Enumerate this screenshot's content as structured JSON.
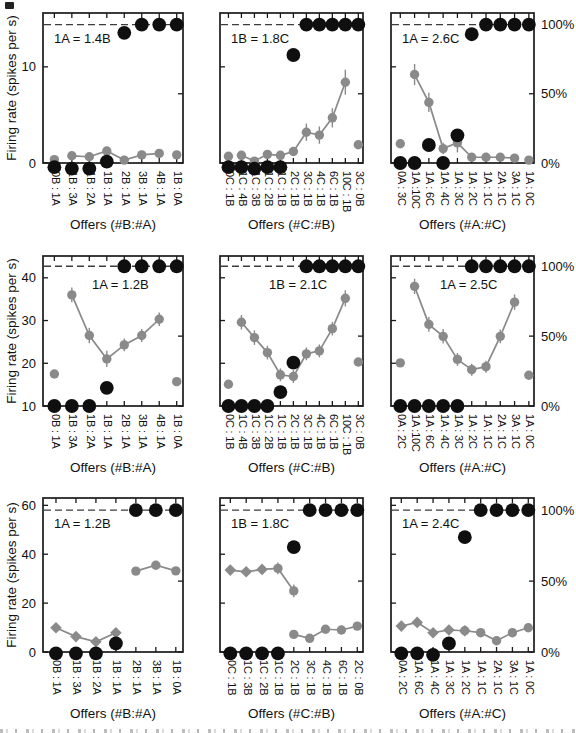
{
  "figure": {
    "y_axis_label": "Firing rate (spikes per s)",
    "pct_axis_labels": {
      "p100": "100%",
      "p50": "50%",
      "p0": "0%"
    },
    "colors": {
      "gray": "#8a8a8a",
      "black": "#0f0f0f",
      "frame": "#1a1a1a",
      "dash": "#3c3c3c",
      "text": "#111111",
      "bg": "#ffffff"
    }
  },
  "chart_data": [
    {
      "id": "r1c1",
      "row": 0,
      "col": 0,
      "type": "scatter-line",
      "title": "1A = 1.4B",
      "xlabel": "Offers (#B:#A)",
      "categories": [
        "0B : 1A",
        "1B : 3A",
        "1B : 2A",
        "1B : 1A",
        "2B : 1A",
        "3B : 1A",
        "4B : 1A",
        "1B : 0A"
      ],
      "left_axis": {
        "ylim": [
          0,
          15.6
        ],
        "ticks": [
          0,
          10
        ],
        "pct100_value": 14.4
      },
      "right_axis": {
        "ticks_pct": [
          0,
          50,
          100
        ]
      },
      "choice_pct_black": [
        -3,
        -4,
        -4,
        1,
        94,
        100,
        100,
        100
      ],
      "firing_gray": [
        {
          "connected": false,
          "marker": "circle",
          "points": [
            {
              "i": 0,
              "v": 0.35,
              "e": 0
            }
          ]
        },
        {
          "connected": true,
          "marker": "circle",
          "points": [
            {
              "i": 1,
              "v": 0.75,
              "e": 0.3
            },
            {
              "i": 2,
              "v": 0.65,
              "e": 0.3
            },
            {
              "i": 3,
              "v": 1.25,
              "e": 0.4
            },
            {
              "i": 4,
              "v": 0.3,
              "e": 0.2
            },
            {
              "i": 5,
              "v": 0.85,
              "e": 0.3
            },
            {
              "i": 6,
              "v": 1.0,
              "e": 0.3
            }
          ]
        },
        {
          "connected": false,
          "marker": "circle",
          "points": [
            {
              "i": 7,
              "v": 0.85,
              "e": 0
            }
          ]
        }
      ]
    },
    {
      "id": "r1c2",
      "row": 0,
      "col": 1,
      "type": "scatter-line",
      "title": "1B = 1.8C",
      "xlabel": "Offers (#C:#B)",
      "categories": [
        "0C : 1B",
        "1C : 4B",
        "1C : 3B",
        "1C : 2B",
        "1C : 1B",
        "2C : 1B",
        "3C : 1B",
        "4C : 1B",
        "6C : 1B",
        "10C : 1B",
        "3C : 0B"
      ],
      "left_axis": {
        "ylim": [
          0,
          15.6
        ],
        "ticks": [
          0,
          10
        ],
        "pct100_value": 14.4
      },
      "right_axis": {
        "ticks_pct": [
          0,
          50,
          100
        ]
      },
      "choice_pct_black": [
        -3,
        -3,
        -4,
        -3,
        -3,
        78,
        100,
        100,
        100,
        100,
        100
      ],
      "firing_gray": [
        {
          "connected": false,
          "marker": "circle",
          "points": [
            {
              "i": 0,
              "v": 0.7,
              "e": 0
            }
          ]
        },
        {
          "connected": true,
          "marker": "circle",
          "points": [
            {
              "i": 1,
              "v": 0.8,
              "e": 0.2
            },
            {
              "i": 2,
              "v": 0.2,
              "e": 0.2
            },
            {
              "i": 3,
              "v": 0.9,
              "e": 0.2
            },
            {
              "i": 4,
              "v": 0.8,
              "e": 0.3
            },
            {
              "i": 5,
              "v": 1.2,
              "e": 0.4
            },
            {
              "i": 6,
              "v": 3.2,
              "e": 0.9
            },
            {
              "i": 7,
              "v": 2.9,
              "e": 0.9
            },
            {
              "i": 8,
              "v": 4.7,
              "e": 1.0
            },
            {
              "i": 9,
              "v": 8.4,
              "e": 1.3
            }
          ]
        },
        {
          "connected": false,
          "marker": "circle",
          "points": [
            {
              "i": 10,
              "v": 1.9,
              "e": 0
            }
          ]
        }
      ]
    },
    {
      "id": "r1c3",
      "row": 0,
      "col": 2,
      "type": "scatter-line",
      "title": "1A = 2.6C",
      "xlabel": "Offers (#A:#C)",
      "categories": [
        "0A : 3C",
        "1A :10C",
        "1A : 6C",
        "1A : 4C",
        "1A : 3C",
        "1A : 2C",
        "1A : 1C",
        "2A : 1C",
        "3A : 1C",
        "1A : 0C"
      ],
      "left_axis": {
        "ylim": [
          0,
          15.6
        ],
        "ticks": [
          0,
          10
        ],
        "pct100_value": 14.4
      },
      "right_axis": {
        "ticks_pct": [
          0,
          50,
          100
        ]
      },
      "choice_pct_black": [
        0,
        0,
        13,
        0,
        20,
        93,
        100,
        100,
        100,
        100
      ],
      "firing_gray": [
        {
          "connected": false,
          "marker": "circle",
          "points": [
            {
              "i": 0,
              "v": 2.0,
              "e": 0
            }
          ]
        },
        {
          "connected": true,
          "marker": "circle",
          "points": [
            {
              "i": 1,
              "v": 9.2,
              "e": 1.1
            },
            {
              "i": 2,
              "v": 6.3,
              "e": 1.0
            },
            {
              "i": 3,
              "v": 1.5,
              "e": 0.6
            },
            {
              "i": 4,
              "v": 2.1,
              "e": 1.0
            },
            {
              "i": 5,
              "v": 0.6,
              "e": 0.2
            },
            {
              "i": 6,
              "v": 0.6,
              "e": 0.2
            },
            {
              "i": 7,
              "v": 0.6,
              "e": 0.2
            },
            {
              "i": 8,
              "v": 0.5,
              "e": 0.2
            }
          ]
        },
        {
          "connected": false,
          "marker": "circle",
          "points": [
            {
              "i": 9,
              "v": 0.3,
              "e": 0
            }
          ]
        }
      ]
    },
    {
      "id": "r2c1",
      "row": 1,
      "col": 0,
      "type": "scatter-line",
      "title": "1A = 1.2B",
      "xlabel": "Offers (#B:#A)",
      "categories": [
        "0B : 1A",
        "1B : 3A",
        "1B : 2A",
        "1B : 1A",
        "2B : 1A",
        "3B : 1A",
        "4B : 1A",
        "1B : 0A"
      ],
      "left_axis": {
        "ylim": [
          10,
          45.1
        ],
        "ticks": [
          10,
          20,
          30,
          40
        ],
        "pct100_value": 42.7
      },
      "right_axis": {
        "ticks_pct": [
          0,
          50,
          100
        ]
      },
      "choice_pct_black": [
        0,
        0,
        0,
        13,
        100,
        100,
        100,
        100
      ],
      "firing_gray": [
        {
          "connected": false,
          "marker": "circle",
          "points": [
            {
              "i": 0,
              "v": 17.5,
              "e": 0
            }
          ]
        },
        {
          "connected": true,
          "marker": "circle",
          "points": [
            {
              "i": 1,
              "v": 36.0,
              "e": 1.7
            },
            {
              "i": 2,
              "v": 26.5,
              "e": 1.8
            },
            {
              "i": 3,
              "v": 21.0,
              "e": 1.9
            },
            {
              "i": 4,
              "v": 24.3,
              "e": 1.5
            },
            {
              "i": 5,
              "v": 26.5,
              "e": 1.5
            },
            {
              "i": 6,
              "v": 30.3,
              "e": 1.6
            }
          ]
        },
        {
          "connected": false,
          "marker": "circle",
          "points": [
            {
              "i": 7,
              "v": 15.7,
              "e": 0
            }
          ]
        }
      ]
    },
    {
      "id": "r2c2",
      "row": 1,
      "col": 1,
      "type": "scatter-line",
      "title": "1B = 2.1C",
      "xlabel": "Offers (#C:#B)",
      "categories": [
        "0C : 1B",
        "1C : 4B",
        "1C : 3B",
        "1C : 2B",
        "1C : 1B",
        "2C : 1B",
        "3C : 1B",
        "4C : 1B",
        "6C : 1B",
        "10C : 1B",
        "3C : 0B"
      ],
      "left_axis": {
        "ylim": [
          10,
          45.1
        ],
        "ticks": [
          10,
          20,
          30,
          40
        ],
        "pct100_value": 42.7
      },
      "right_axis": {
        "ticks_pct": [
          0,
          50,
          100
        ]
      },
      "choice_pct_black": [
        0,
        0,
        0,
        0,
        10,
        31,
        100,
        100,
        100,
        100,
        100
      ],
      "firing_gray": [
        {
          "connected": false,
          "marker": "circle",
          "points": [
            {
              "i": 0,
              "v": 15.1,
              "e": 0
            }
          ]
        },
        {
          "connected": true,
          "marker": "circle",
          "points": [
            {
              "i": 1,
              "v": 29.6,
              "e": 1.7
            },
            {
              "i": 2,
              "v": 26.0,
              "e": 1.7
            },
            {
              "i": 3,
              "v": 22.5,
              "e": 1.6
            },
            {
              "i": 4,
              "v": 17.3,
              "e": 1.5
            },
            {
              "i": 5,
              "v": 16.9,
              "e": 1.5
            },
            {
              "i": 6,
              "v": 22.2,
              "e": 1.5
            },
            {
              "i": 7,
              "v": 22.9,
              "e": 1.5
            },
            {
              "i": 8,
              "v": 28.1,
              "e": 1.6
            },
            {
              "i": 9,
              "v": 35.2,
              "e": 1.9
            }
          ]
        },
        {
          "connected": false,
          "marker": "circle",
          "points": [
            {
              "i": 10,
              "v": 20.3,
              "e": 0
            }
          ]
        }
      ]
    },
    {
      "id": "r2c3",
      "row": 1,
      "col": 2,
      "type": "scatter-line",
      "title": "1A = 2.5C",
      "xlabel": "Offers (#A:#C)",
      "categories": [
        "0A : 2C",
        "1A :10C",
        "1A : 6C",
        "1A : 4C",
        "1A : 3C",
        "1A : 2C",
        "1A : 1C",
        "2A : 1C",
        "3A : 1C",
        "1A : 0C"
      ],
      "left_axis": {
        "ylim": [
          10,
          45.1
        ],
        "ticks": [
          10,
          20,
          30,
          40
        ],
        "pct100_value": 42.7
      },
      "right_axis": {
        "ticks_pct": [
          0,
          50,
          100
        ]
      },
      "choice_pct_black": [
        0,
        0,
        0,
        0,
        0,
        100,
        100,
        100,
        100,
        100
      ],
      "firing_gray": [
        {
          "connected": false,
          "marker": "circle",
          "points": [
            {
              "i": 0,
              "v": 20.1,
              "e": 0
            }
          ]
        },
        {
          "connected": true,
          "marker": "circle",
          "points": [
            {
              "i": 1,
              "v": 38.0,
              "e": 1.8
            },
            {
              "i": 2,
              "v": 29.1,
              "e": 1.7
            },
            {
              "i": 3,
              "v": 26.3,
              "e": 1.7
            },
            {
              "i": 4,
              "v": 20.9,
              "e": 1.5
            },
            {
              "i": 5,
              "v": 18.5,
              "e": 1.4
            },
            {
              "i": 6,
              "v": 19.2,
              "e": 1.4
            },
            {
              "i": 7,
              "v": 26.3,
              "e": 1.6
            },
            {
              "i": 8,
              "v": 34.3,
              "e": 1.8
            }
          ]
        },
        {
          "connected": false,
          "marker": "circle",
          "points": [
            {
              "i": 9,
              "v": 17.2,
              "e": 0
            }
          ]
        }
      ]
    },
    {
      "id": "r3c1",
      "row": 2,
      "col": 0,
      "type": "scatter-line",
      "title": "1A = 1.2B",
      "xlabel": "Offers (#B:#A)",
      "categories": [
        "0B : 1A",
        "1B : 3A",
        "1B : 2A",
        "1B : 1A",
        "2B : 1A",
        "3B : 1A",
        "1B : 0A"
      ],
      "left_axis": {
        "ylim": [
          0,
          63
        ],
        "ticks": [
          0,
          20,
          40,
          60
        ],
        "pct100_value": 58
      },
      "right_axis": {
        "ticks_pct": [
          0,
          50,
          100
        ]
      },
      "choice_pct_black": [
        -1,
        -1,
        -1,
        6,
        100,
        100,
        100
      ],
      "firing_gray": [
        {
          "connected": true,
          "marker": "diamond",
          "points": [
            {
              "i": 0,
              "v": 9.9,
              "e": 0.9
            },
            {
              "i": 1,
              "v": 6.3,
              "e": 0.9
            },
            {
              "i": 2,
              "v": 4.2,
              "e": 0.8
            },
            {
              "i": 3,
              "v": 7.9,
              "e": 1.4
            }
          ]
        },
        {
          "connected": true,
          "marker": "circle",
          "points": [
            {
              "i": 4,
              "v": 33.1,
              "e": 1.4
            },
            {
              "i": 5,
              "v": 35.5,
              "e": 1.4
            },
            {
              "i": 6,
              "v": 33.2,
              "e": 1.4
            }
          ]
        }
      ]
    },
    {
      "id": "r3c2",
      "row": 2,
      "col": 1,
      "type": "scatter-line",
      "title": "1B = 1.8C",
      "xlabel": "Offers (#C:#B)",
      "categories": [
        "0C : 1B",
        "1C : 3B",
        "1C : 2B",
        "1C : 1B",
        "2C : 1B",
        "3C : 1B",
        "4C : 1B",
        "6C : 1B",
        "2C : 0B"
      ],
      "left_axis": {
        "ylim": [
          0,
          63
        ],
        "ticks": [
          0,
          20,
          40,
          60
        ],
        "pct100_value": 58
      },
      "right_axis": {
        "ticks_pct": [
          0,
          50,
          100
        ]
      },
      "choice_pct_black": [
        -1,
        -1,
        -1,
        -1,
        74,
        100,
        100,
        100,
        100
      ],
      "firing_gray": [
        {
          "connected": true,
          "marker": "diamond",
          "points": [
            {
              "i": 0,
              "v": 33.5,
              "e": 0.9
            },
            {
              "i": 1,
              "v": 32.8,
              "e": 0.9
            },
            {
              "i": 2,
              "v": 33.8,
              "e": 1.0
            },
            {
              "i": 3,
              "v": 34.2,
              "e": 2.4,
              "m": "circle"
            },
            {
              "i": 4,
              "v": 25.0,
              "e": 2.6,
              "m": "circle"
            }
          ]
        },
        {
          "connected": true,
          "marker": "circle",
          "points": [
            {
              "i": 4,
              "v": 7.2,
              "e": 0.8
            },
            {
              "i": 5,
              "v": 5.6,
              "e": 0.8
            },
            {
              "i": 6,
              "v": 9.3,
              "e": 0.8
            },
            {
              "i": 7,
              "v": 9.0,
              "e": 0.8
            },
            {
              "i": 8,
              "v": 10.6,
              "e": 0.9
            }
          ]
        }
      ]
    },
    {
      "id": "r3c3",
      "row": 2,
      "col": 2,
      "type": "scatter-line",
      "title": "1A = 2.4C",
      "xlabel": "Offers (#A:#C)",
      "categories": [
        "0A : 2C",
        "1A : 6C",
        "1A : 4C",
        "1A : 3C",
        "1A : 2C",
        "1A : 1C",
        "2A : 1C",
        "3A : 1C",
        "1A : 0C"
      ],
      "left_axis": {
        "ylim": [
          0,
          63
        ],
        "ticks": [
          0,
          20,
          40,
          60
        ],
        "pct100_value": 58
      },
      "right_axis": {
        "ticks_pct": [
          0,
          50,
          100
        ]
      },
      "choice_pct_black": [
        -1,
        -1,
        -2,
        6,
        81,
        100,
        100,
        100,
        100
      ],
      "firing_gray": [
        {
          "connected": true,
          "marker": "diamond",
          "points": [
            {
              "i": 0,
              "v": 10.6,
              "e": 0.8
            },
            {
              "i": 1,
              "v": 12.1,
              "e": 0.9
            },
            {
              "i": 2,
              "v": 7.9,
              "e": 0.8
            },
            {
              "i": 3,
              "v": 9.0,
              "e": 0.8
            },
            {
              "i": 4,
              "v": 8.7,
              "e": 0.8
            }
          ]
        },
        {
          "connected": true,
          "marker": "circle",
          "points": [
            {
              "i": 4,
              "v": 8.7,
              "e": 0.8
            },
            {
              "i": 5,
              "v": 7.9,
              "e": 0.8
            },
            {
              "i": 6,
              "v": 4.6,
              "e": 0.7
            },
            {
              "i": 7,
              "v": 7.9,
              "e": 0.8
            },
            {
              "i": 8,
              "v": 9.9,
              "e": 0.8
            }
          ]
        }
      ]
    }
  ]
}
